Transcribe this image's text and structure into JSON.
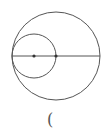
{
  "diagram": {
    "type": "geometry",
    "outer_circle": {
      "cx": 56,
      "cy": 56,
      "r": 44
    },
    "inner_circle": {
      "cx": 34,
      "cy": 56,
      "r": 22
    },
    "diameter_line": {
      "x1": 12,
      "y1": 56,
      "x2": 100,
      "y2": 56
    },
    "points": [
      {
        "x": 34,
        "y": 56
      },
      {
        "x": 56,
        "y": 56
      }
    ],
    "stroke_color": "#555555"
  },
  "caption": {
    "text": "("
  }
}
